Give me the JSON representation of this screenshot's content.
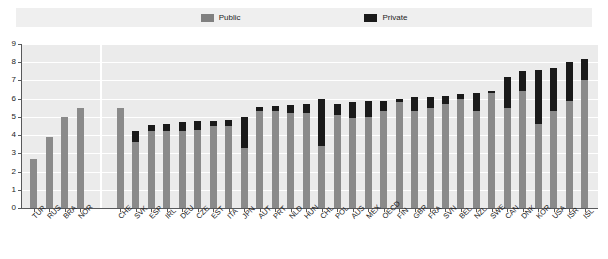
{
  "legend": {
    "items": [
      {
        "label": "Public",
        "color": "#808080",
        "name": "public"
      },
      {
        "label": "Private",
        "color": "#1a1a1a",
        "name": "private"
      }
    ]
  },
  "axis": {
    "y_ticks": [
      "0",
      "1",
      "2",
      "3",
      "4",
      "5",
      "6",
      "7",
      "8",
      "9"
    ],
    "y_min": 0,
    "y_max": 9
  },
  "chart_data": {
    "type": "bar",
    "title": "",
    "subtitle": "",
    "xlabel": "",
    "ylabel": "",
    "ylim": [
      0,
      9
    ],
    "grid": true,
    "legend_position": "top",
    "stacked": true,
    "group_break_after_index": 4,
    "categories": [
      "TUR",
      "RUS",
      "BRA",
      "NOR",
      "CHE",
      "SVK",
      "ESP",
      "IRL",
      "DEU",
      "CZE",
      "EST",
      "ITA",
      "JPN",
      "AUT",
      "PRT",
      "NLD",
      "HUN",
      "CHL",
      "POL",
      "AUS",
      "MEX",
      "OECD",
      "FIN",
      "GBR",
      "FRA",
      "SVN",
      "BEL",
      "NZL",
      "SWE",
      "CAN",
      "DNK",
      "KOR",
      "USA",
      "ISR",
      "ISL"
    ],
    "series": [
      {
        "name": "Public",
        "color": "#8a8a8a",
        "values": [
          2.7,
          3.9,
          5.0,
          5.5,
          5.5,
          3.6,
          4.2,
          4.25,
          4.2,
          4.3,
          4.5,
          4.5,
          3.3,
          5.3,
          5.3,
          5.2,
          5.2,
          3.4,
          5.1,
          4.95,
          5.0,
          5.35,
          5.8,
          5.3,
          5.5,
          5.7,
          6.0,
          5.3,
          6.3,
          5.5,
          6.4,
          4.6,
          5.3,
          5.9,
          7.0
        ]
      },
      {
        "name": "Private",
        "color": "#1a1a1a",
        "values": [
          0.0,
          0.0,
          0.0,
          0.0,
          0.0,
          0.6,
          0.35,
          0.35,
          0.5,
          0.45,
          0.3,
          0.35,
          1.7,
          0.25,
          0.3,
          0.45,
          0.5,
          2.6,
          0.6,
          0.85,
          0.85,
          0.55,
          0.2,
          0.8,
          0.6,
          0.45,
          0.25,
          1.0,
          0.1,
          1.7,
          1.1,
          3.0,
          2.4,
          2.1,
          1.2
        ]
      }
    ],
    "totals": [
      2.7,
      3.9,
      5.0,
      5.5,
      5.5,
      4.2,
      4.55,
      4.6,
      4.7,
      4.75,
      4.8,
      4.85,
      5.0,
      5.55,
      5.6,
      5.65,
      5.7,
      6.0,
      5.7,
      5.8,
      5.85,
      5.9,
      6.0,
      6.1,
      6.1,
      6.15,
      6.25,
      6.3,
      6.4,
      7.2,
      7.5,
      7.6,
      7.7,
      8.0,
      8.2
    ]
  },
  "colors": {
    "plot_background": "#ebebeb",
    "legend_background": "#efefef",
    "gridline": "#ffffff",
    "axis": "#58595b",
    "public": "#8a8a8a",
    "private": "#1a1a1a"
  }
}
